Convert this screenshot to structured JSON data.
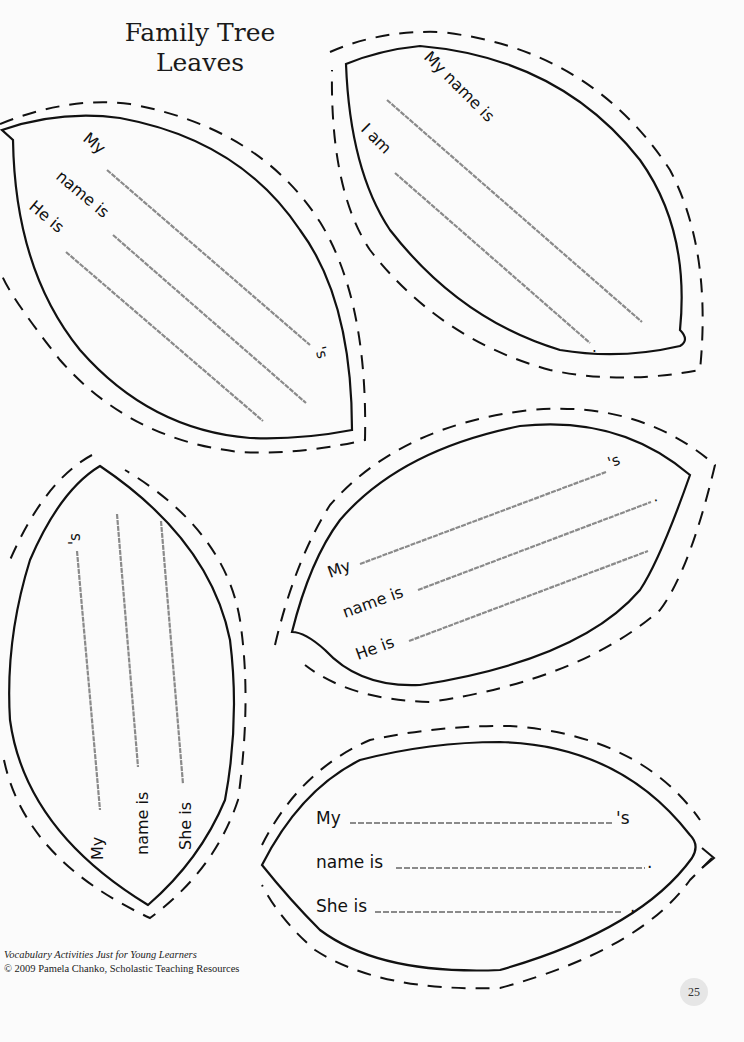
{
  "title": {
    "line1": "Family Tree",
    "line2": "Leaves"
  },
  "leaves": [
    {
      "id": "leaf-top-left",
      "prompts": [
        "My",
        "name is",
        "He is"
      ],
      "endings": [
        "'s",
        ".",
        ""
      ]
    },
    {
      "id": "leaf-top-right",
      "prompts": [
        "My name is",
        "I am"
      ],
      "endings": [
        "",
        "."
      ]
    },
    {
      "id": "leaf-bottom-left-vertical",
      "prompts": [
        "My",
        "name is",
        "She is"
      ],
      "endings": [
        "'s",
        ".",
        "."
      ]
    },
    {
      "id": "leaf-middle-right",
      "prompts": [
        "My",
        "name is",
        "He is"
      ],
      "endings": [
        "'s",
        ".",
        ""
      ]
    },
    {
      "id": "leaf-bottom-right",
      "prompts": [
        "My",
        "name is",
        "She is"
      ],
      "endings": [
        "'s",
        ".",
        "."
      ]
    }
  ],
  "footer": {
    "book": "Vocabulary Activities Just for Young Learners",
    "copyright": "© 2009 Pamela Chanko, Scholastic Teaching Resources"
  },
  "page_number": "25",
  "colors": {
    "outline": "#111111",
    "writing_line": "#8a8a8a",
    "page": "#fbfbfb"
  }
}
